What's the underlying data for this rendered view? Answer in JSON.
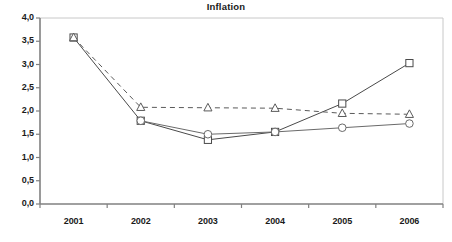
{
  "chart_data": {
    "type": "line",
    "title": "Inflation",
    "xlabel": "",
    "ylabel": "",
    "categories": [
      "2001",
      "2002",
      "2003",
      "2004",
      "2005",
      "2006"
    ],
    "x": [
      2001,
      2002,
      2003,
      2004,
      2005,
      2006
    ],
    "ylim": [
      0.0,
      4.0
    ],
    "ytick_values": [
      0.0,
      0.5,
      1.0,
      1.5,
      2.0,
      2.5,
      3.0,
      3.5,
      4.0
    ],
    "ytick_labels": [
      "0,0",
      "0,5",
      "1,0",
      "1,5",
      "2,0",
      "2,5",
      "3,0",
      "3,5",
      "4,0"
    ],
    "xtick_labels": [
      "2001",
      "2002",
      "2003",
      "2004",
      "2005",
      "2006"
    ],
    "decimal_separator": ",",
    "grid": false,
    "legend": "none",
    "series": [
      {
        "name": "square-series",
        "marker": "square",
        "line_style": "solid",
        "color": "#4a4a4a",
        "x": [
          2001,
          2002,
          2003,
          2004,
          2005,
          2006
        ],
        "values": [
          3.58,
          1.79,
          1.38,
          1.55,
          2.16,
          3.03
        ]
      },
      {
        "name": "circle-series",
        "marker": "circle",
        "line_style": "solid",
        "color": "#6a6a6a",
        "x": [
          2002,
          2003,
          2004,
          2005,
          2006
        ],
        "values": [
          1.79,
          1.5,
          1.55,
          1.64,
          1.73
        ]
      },
      {
        "name": "triangle-series",
        "marker": "triangle",
        "line_style": "dashed",
        "color": "#5a5a5a",
        "x": [
          2001,
          2002,
          2003,
          2004,
          2005,
          2006
        ],
        "values": [
          3.58,
          2.08,
          2.07,
          2.06,
          1.95,
          1.93
        ]
      }
    ]
  },
  "axis": {
    "axis_color": "#808080",
    "plot_border_color": "#c8c8c8"
  }
}
